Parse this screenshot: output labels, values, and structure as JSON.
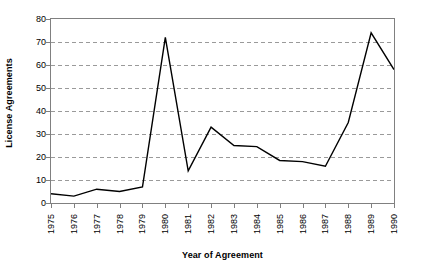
{
  "chart_data": {
    "type": "line",
    "title": "",
    "xlabel": "Year of Agreement",
    "ylabel": "License Agreements",
    "categories": [
      "1975",
      "1976",
      "1977",
      "1978",
      "1979",
      "1980",
      "1981",
      "1982",
      "1983",
      "1984",
      "1985",
      "1986",
      "1987",
      "1988",
      "1989",
      "1990"
    ],
    "values": [
      4,
      3,
      6,
      5,
      7,
      72,
      14,
      33,
      25,
      24.5,
      18.5,
      18,
      16,
      35,
      74,
      58
    ],
    "series": [
      {
        "name": "License Agreements",
        "values": [
          4,
          3,
          6,
          5,
          7,
          72,
          14,
          33,
          25,
          24.5,
          18.5,
          18,
          16,
          35,
          74,
          58
        ]
      }
    ],
    "ylim": [
      0,
      80
    ],
    "yticks": [
      0,
      10,
      20,
      30,
      40,
      50,
      60,
      70,
      80
    ],
    "ytick_labels": [
      "0",
      "10",
      "20",
      "30",
      "40",
      "50",
      "60",
      "70",
      "80"
    ],
    "grid": "horizontal-dashed",
    "legend": "none",
    "line_color": "#000000",
    "grid_color": "#9a9a9a",
    "axis_color": "#808080",
    "background": "#ffffff"
  }
}
